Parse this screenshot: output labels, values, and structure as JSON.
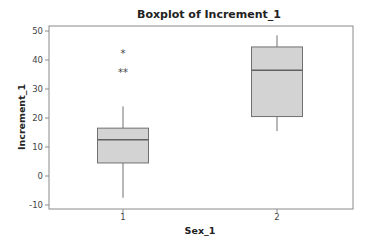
{
  "chart_data": {
    "type": "boxplot",
    "title": "Boxplot of Increment_1",
    "xlabel": "Sex_1",
    "ylabel": "Increment_1",
    "categories": [
      "1",
      "2"
    ],
    "ylim": [
      -12,
      51
    ],
    "yticks": [
      -10,
      0,
      10,
      20,
      30,
      40,
      50
    ],
    "grid": false,
    "legend": null,
    "boxes": [
      {
        "category": "1",
        "whisker_low": -7.5,
        "q1": 4.5,
        "median": 12.5,
        "q3": 16.5,
        "whisker_high": 24,
        "outliers": [
          42.5,
          36,
          36
        ]
      },
      {
        "category": "2",
        "whisker_low": 15.5,
        "q1": 20.5,
        "median": 36.5,
        "q3": 44.5,
        "whisker_high": 48.5,
        "outliers": []
      }
    ],
    "colors": {
      "box_fill": "#d3d3d3",
      "box_stroke": "#707070",
      "median": "#606060",
      "frame": "#8a8a8a"
    }
  }
}
